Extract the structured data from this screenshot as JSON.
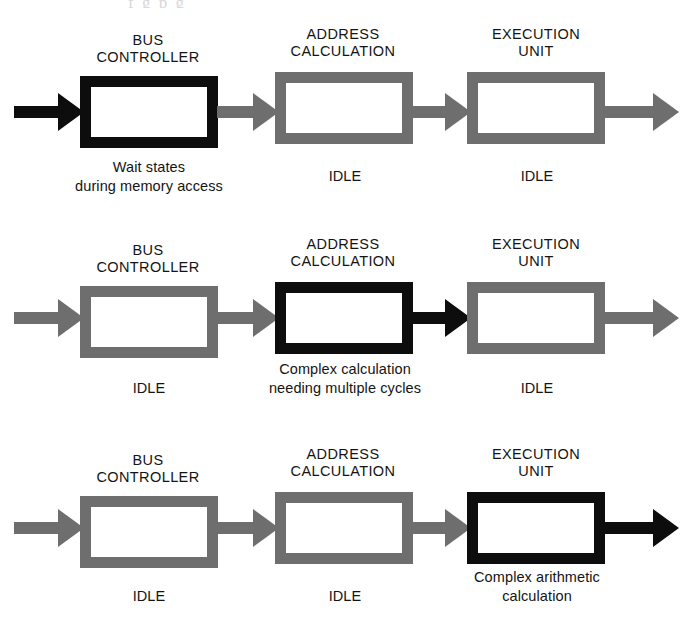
{
  "diagram": {
    "page_top_artifact": "f      g  p  g",
    "stage_titles": {
      "bus_controller": "BUS\nCONTROLLER",
      "address_calculation": "ADDRESS\nCALCULATION",
      "execution_unit": "EXECUTION\nUNIT"
    },
    "colors": {
      "idle_stage": "#6e6e6e",
      "active_stage": "#0d0d0d",
      "background": "#ffffff",
      "text": "#141414"
    },
    "rows": [
      {
        "id": "row-bus-controller-busy",
        "stages": [
          {
            "name": "bus-controller",
            "title": "BUS\nCONTROLLER",
            "state": "active",
            "caption": "Wait states\nduring memory access"
          },
          {
            "name": "address-calculation",
            "title": "ADDRESS\nCALCULATION",
            "state": "idle",
            "caption": "IDLE"
          },
          {
            "name": "execution-unit",
            "title": "EXECUTION\nUNIT",
            "state": "idle",
            "caption": "IDLE"
          }
        ],
        "arrows": [
          {
            "name": "input-arrow",
            "style": "black"
          },
          {
            "name": "arrow-bus-to-address",
            "style": "gray"
          },
          {
            "name": "arrow-address-to-execution",
            "style": "gray"
          },
          {
            "name": "output-arrow",
            "style": "gray"
          }
        ]
      },
      {
        "id": "row-address-calculation-busy",
        "stages": [
          {
            "name": "bus-controller",
            "title": "BUS\nCONTROLLER",
            "state": "idle",
            "caption": "IDLE"
          },
          {
            "name": "address-calculation",
            "title": "ADDRESS\nCALCULATION",
            "state": "active",
            "caption": "Complex calculation\nneeding  multiple cycles"
          },
          {
            "name": "execution-unit",
            "title": "EXECUTION\nUNIT",
            "state": "idle",
            "caption": "IDLE"
          }
        ],
        "arrows": [
          {
            "name": "input-arrow",
            "style": "gray"
          },
          {
            "name": "arrow-bus-to-address",
            "style": "gray"
          },
          {
            "name": "arrow-address-to-execution",
            "style": "black"
          },
          {
            "name": "output-arrow",
            "style": "gray"
          }
        ]
      },
      {
        "id": "row-execution-unit-busy",
        "stages": [
          {
            "name": "bus-controller",
            "title": "BUS\nCONTROLLER",
            "state": "idle",
            "caption": "IDLE"
          },
          {
            "name": "address-calculation",
            "title": "ADDRESS\nCALCULATION",
            "state": "idle",
            "caption": "IDLE"
          },
          {
            "name": "execution-unit",
            "title": "EXECUTION\nUNIT",
            "state": "active",
            "caption": "Complex  arithmetic\ncalculation"
          }
        ],
        "arrows": [
          {
            "name": "input-arrow",
            "style": "gray"
          },
          {
            "name": "arrow-bus-to-address",
            "style": "gray"
          },
          {
            "name": "arrow-address-to-execution",
            "style": "gray"
          },
          {
            "name": "output-arrow",
            "style": "black"
          }
        ]
      }
    ]
  }
}
